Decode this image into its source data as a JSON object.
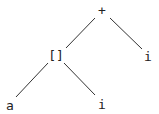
{
  "tree": {
    "nodes": [
      {
        "id": "plus",
        "label": "+",
        "x": 102,
        "y": 10
      },
      {
        "id": "index",
        "label": "[]",
        "x": 56,
        "y": 55
      },
      {
        "id": "i_right",
        "label": "i",
        "x": 148,
        "y": 56
      },
      {
        "id": "a",
        "label": "a",
        "x": 10,
        "y": 107
      },
      {
        "id": "i_bottom",
        "label": "i",
        "x": 102,
        "y": 105
      }
    ],
    "edges": [
      {
        "from": "plus",
        "to": "index"
      },
      {
        "from": "plus",
        "to": "i_right"
      },
      {
        "from": "index",
        "to": "a"
      },
      {
        "from": "index",
        "to": "i_bottom"
      }
    ]
  }
}
